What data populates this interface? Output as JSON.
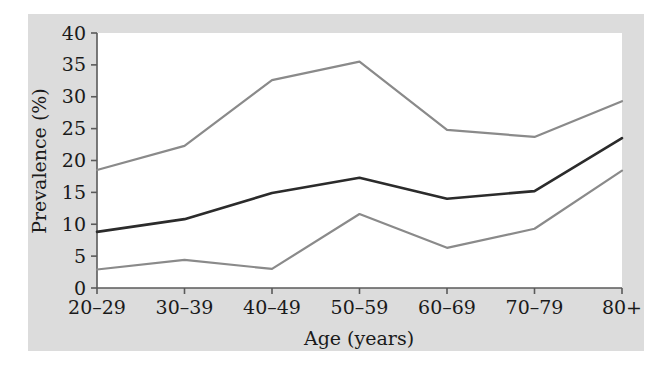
{
  "figure": {
    "panel_background": "#dcdcdc",
    "plot_background": "#ffffff",
    "axis_color": "#5a5a5a",
    "text_color": "#1a1a1a"
  },
  "chart_data": {
    "type": "line",
    "title": "",
    "xlabel": "Age (years)",
    "ylabel": "Prevalence (%)",
    "categories": [
      "20–29",
      "30–39",
      "40–49",
      "50–59",
      "60–69",
      "70–79",
      "80+"
    ],
    "ylim": [
      0,
      40
    ],
    "yticks": [
      0,
      5,
      10,
      15,
      20,
      25,
      30,
      35,
      40
    ],
    "ytick_labels": [
      "0",
      "5",
      "10",
      "15",
      "20",
      "25",
      "30",
      "35",
      "40"
    ],
    "grid": false,
    "legend": "none",
    "series": [
      {
        "name": "Upper estimate",
        "color": "#8a8a8a",
        "width": 2.2,
        "values": [
          18.5,
          22.3,
          32.6,
          35.5,
          24.8,
          23.7,
          29.3
        ]
      },
      {
        "name": "Central estimate",
        "color": "#2b2b2b",
        "width": 2.6,
        "values": [
          8.8,
          10.8,
          14.9,
          17.3,
          14.0,
          15.2,
          23.5
        ]
      },
      {
        "name": "Lower estimate",
        "color": "#8a8a8a",
        "width": 2.2,
        "values": [
          2.9,
          4.4,
          3.0,
          11.6,
          6.3,
          9.3,
          18.4
        ]
      }
    ]
  }
}
